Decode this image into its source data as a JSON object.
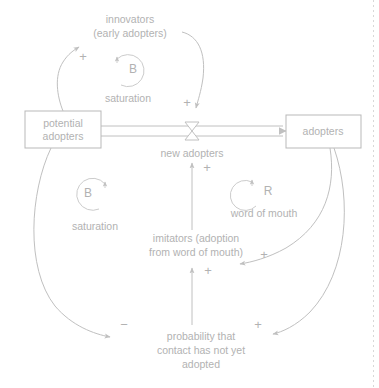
{
  "diagram": {
    "type": "causal-loop-diagram",
    "stocks": [
      {
        "id": "potential-adopters",
        "label_line1": "potential",
        "label_line2": "adopters",
        "x": 25,
        "y": 111,
        "w": 76,
        "h": 37
      },
      {
        "id": "adopters",
        "label_line1": "adopters",
        "label_line2": "",
        "x": 286,
        "y": 115,
        "w": 75,
        "h": 33
      }
    ],
    "flow": {
      "id": "new-adopters",
      "label": "new adopters",
      "valve_x": 192,
      "valve_y": 131
    },
    "auxiliaries": [
      {
        "id": "innovators",
        "label_line1": "innovators",
        "label_line2": "(early adopters)",
        "x": 130,
        "y": 17
      },
      {
        "id": "imitators",
        "label_line1": "imitators (adoption",
        "label_line2": "from word of mouth)",
        "x": 196,
        "y": 240
      },
      {
        "id": "probability",
        "label_line1": "probability that",
        "label_line2": "contact has not yet",
        "label_line3": "adopted",
        "x": 201,
        "y": 338
      }
    ],
    "loops": [
      {
        "id": "balancing-saturation-top",
        "letter": "B",
        "name": "saturation",
        "cx": 128,
        "cy": 70,
        "name_x": 128,
        "name_y": 99
      },
      {
        "id": "balancing-saturation-bottom",
        "letter": "B",
        "name": "saturation",
        "cx": 92,
        "cy": 194,
        "name_x": 95,
        "name_y": 227
      },
      {
        "id": "reinforcing-word-of-mouth",
        "letter": "R",
        "name": "word of mouth",
        "cx": 263,
        "cy": 192,
        "name_x": 264,
        "name_y": 214
      }
    ],
    "link_signs": [
      {
        "id": "sign-potential-to-innovators",
        "symbol": "+",
        "x": 83,
        "y": 58
      },
      {
        "id": "sign-innovators-to-flow",
        "symbol": "+",
        "x": 187,
        "y": 104
      },
      {
        "id": "sign-imitators-to-flow",
        "symbol": "+",
        "x": 207,
        "y": 169
      },
      {
        "id": "sign-adopters-to-imitators",
        "symbol": "+",
        "x": 264,
        "y": 256
      },
      {
        "id": "sign-probability-to-imitators",
        "symbol": "+",
        "x": 208,
        "y": 272
      },
      {
        "id": "sign-potential-to-probability",
        "symbol": "−",
        "x": 124,
        "y": 326
      },
      {
        "id": "sign-adopters-to-probability",
        "symbol": "+",
        "x": 258,
        "y": 326
      }
    ],
    "colors": {
      "line": "#c0c0c0",
      "text": "#b2b2b2",
      "box_stroke": "#b9b9b9",
      "background": "#ffffff"
    }
  }
}
